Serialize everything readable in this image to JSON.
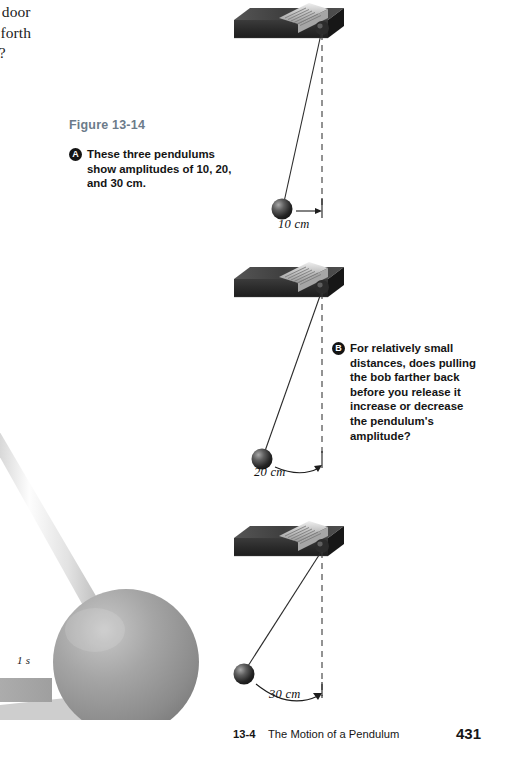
{
  "page": {
    "body_copy": "nging door k and forth conds?",
    "body_copy_lines": [
      "nging door",
      "k and forth",
      "conds?"
    ]
  },
  "figure": {
    "label": "Figure 13-14",
    "label_color": "#6c7b8a",
    "captions": [
      {
        "bullet": "A",
        "text": "These three pendulums show amplitudes of 10, 20, and 30 cm."
      },
      {
        "bullet": "B",
        "text": "For relatively small distances, does pulling the bob farther back before you release it increase or decrease the pendulum's amplitude?"
      }
    ],
    "pendulums": [
      {
        "amplitude_label": "10 cm",
        "amplitude_cm": 10
      },
      {
        "amplitude_label": "20 cm",
        "amplitude_cm": 20
      },
      {
        "amplitude_label": "30 cm",
        "amplitude_cm": 30
      }
    ]
  },
  "illustration": {
    "time_label": "1 s"
  },
  "footer": {
    "section": "13-4",
    "title": "The Motion of a Pendulum",
    "page_number": "431"
  },
  "colors": {
    "figure_label": "#6c7b8a",
    "block_dark": "#2e2e2e",
    "block_top": "#4a4a4a",
    "clamp_light": "#c9c9c9",
    "bob_dark": "#2a2a2a",
    "sphere_gray": "#9a9a9a",
    "text": "#141414"
  }
}
